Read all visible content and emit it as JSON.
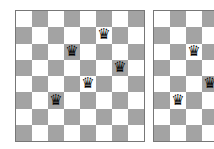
{
  "colors": {
    "light": "#ffffff",
    "dark": "#a3a3a3",
    "piece": "#000000"
  },
  "queen_glyph": "♛",
  "boards": [
    {
      "id": "board1",
      "queens": [
        [
          1,
          5
        ],
        [
          2,
          3
        ],
        [
          3,
          6
        ],
        [
          4,
          4
        ],
        [
          5,
          2
        ]
      ]
    },
    {
      "id": "board2",
      "queens": [
        [
          2,
          2
        ],
        [
          4,
          3
        ],
        [
          5,
          1
        ]
      ]
    }
  ]
}
